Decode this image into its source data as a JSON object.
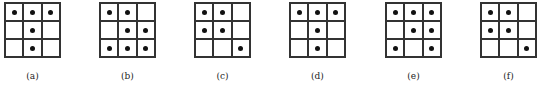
{
  "figure": {
    "panels": [
      {
        "label": "(a)",
        "x": 4,
        "dots": [
          [
            1,
            1,
            1
          ],
          [
            0,
            1,
            0
          ],
          [
            0,
            1,
            0
          ]
        ]
      },
      {
        "label": "(b)",
        "x": 99,
        "dots": [
          [
            1,
            1,
            0
          ],
          [
            0,
            1,
            1
          ],
          [
            1,
            1,
            1
          ]
        ]
      },
      {
        "label": "(c)",
        "x": 194,
        "dots": [
          [
            1,
            1,
            0
          ],
          [
            1,
            1,
            0
          ],
          [
            0,
            0,
            1
          ]
        ]
      },
      {
        "label": "(d)",
        "x": 289,
        "dots": [
          [
            1,
            1,
            1
          ],
          [
            0,
            1,
            0
          ],
          [
            0,
            1,
            0
          ]
        ]
      },
      {
        "label": "(e)",
        "x": 385,
        "dots": [
          [
            1,
            1,
            1
          ],
          [
            0,
            1,
            1
          ],
          [
            1,
            0,
            1
          ]
        ]
      },
      {
        "label": "(f)",
        "x": 480,
        "dots": [
          [
            1,
            1,
            0
          ],
          [
            1,
            1,
            0
          ],
          [
            0,
            0,
            1
          ]
        ]
      }
    ]
  }
}
